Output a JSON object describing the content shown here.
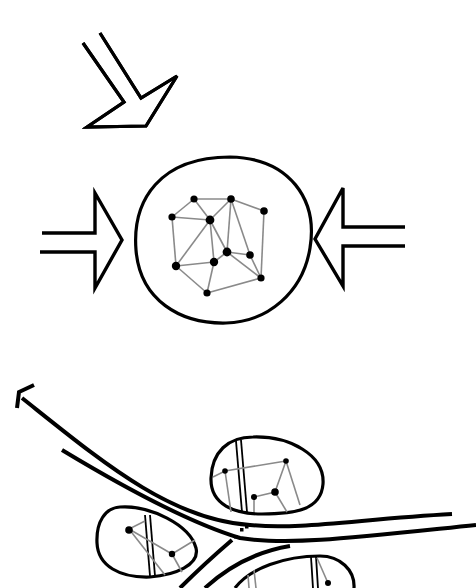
{
  "diagram": {
    "title": "",
    "background": "#ffffff",
    "stroke_color": "#000000",
    "edge_color": "#8a8a8a",
    "top_section": {
      "description": "Cluster network enclosed in a circle, pressed by arrows from left, right and upper-left",
      "arrows": [
        {
          "name": "arrow-diagonal",
          "direction": "down-right"
        },
        {
          "name": "arrow-left",
          "direction": "right"
        },
        {
          "name": "arrow-right",
          "direction": "left"
        }
      ],
      "circle": {
        "cx": 226,
        "cy": 238,
        "rx": 88,
        "ry": 82
      },
      "network": {
        "nodes": [
          [
            194,
            199
          ],
          [
            231,
            199
          ],
          [
            264,
            211
          ],
          [
            172,
            217
          ],
          [
            210,
            220
          ],
          [
            227,
            252
          ],
          [
            250,
            255
          ],
          [
            176,
            266
          ],
          [
            214,
            262
          ],
          [
            207,
            293
          ],
          [
            261,
            278
          ]
        ],
        "edges": [
          [
            0,
            1
          ],
          [
            0,
            3
          ],
          [
            0,
            4
          ],
          [
            1,
            4
          ],
          [
            1,
            2
          ],
          [
            1,
            5
          ],
          [
            1,
            6
          ],
          [
            2,
            10
          ],
          [
            3,
            4
          ],
          [
            3,
            7
          ],
          [
            4,
            7
          ],
          [
            4,
            8
          ],
          [
            4,
            5
          ],
          [
            5,
            6
          ],
          [
            5,
            8
          ],
          [
            5,
            10
          ],
          [
            6,
            10
          ],
          [
            7,
            8
          ],
          [
            7,
            9
          ],
          [
            8,
            9
          ],
          [
            9,
            10
          ]
        ]
      }
    },
    "bottom_section": {
      "description": "Branching transport corridors linking enclosed node clusters",
      "corridor_arrow": {
        "direction": "up-left"
      },
      "clusters": [
        {
          "name": "cluster-upper",
          "nodes": [
            [
              225,
              470
            ],
            [
              286,
              461
            ],
            [
              254,
              496
            ],
            [
              275,
              492
            ]
          ]
        },
        {
          "name": "cluster-left",
          "nodes": [
            [
              129,
              530
            ],
            [
              172,
              554
            ]
          ]
        },
        {
          "name": "cluster-lower",
          "nodes": [
            [
              328,
              583
            ]
          ]
        }
      ]
    }
  }
}
